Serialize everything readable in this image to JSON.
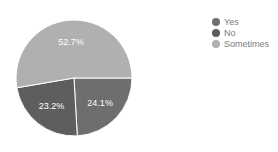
{
  "chart_data": {
    "type": "pie",
    "title": "",
    "categories": [
      "Yes",
      "No",
      "Sometimes"
    ],
    "values": [
      24.1,
      23.2,
      52.7
    ],
    "labels": [
      "24.1%",
      "23.2%",
      "52.7%"
    ],
    "colors": [
      "#6e6e6e",
      "#5e5e5e",
      "#b0b0b0"
    ],
    "legend_position": "right"
  },
  "legend": {
    "items": [
      {
        "label": "Yes",
        "color": "#6e6e6e"
      },
      {
        "label": "No",
        "color": "#5e5e5e"
      },
      {
        "label": "Sometimes",
        "color": "#b0b0b0"
      }
    ]
  }
}
